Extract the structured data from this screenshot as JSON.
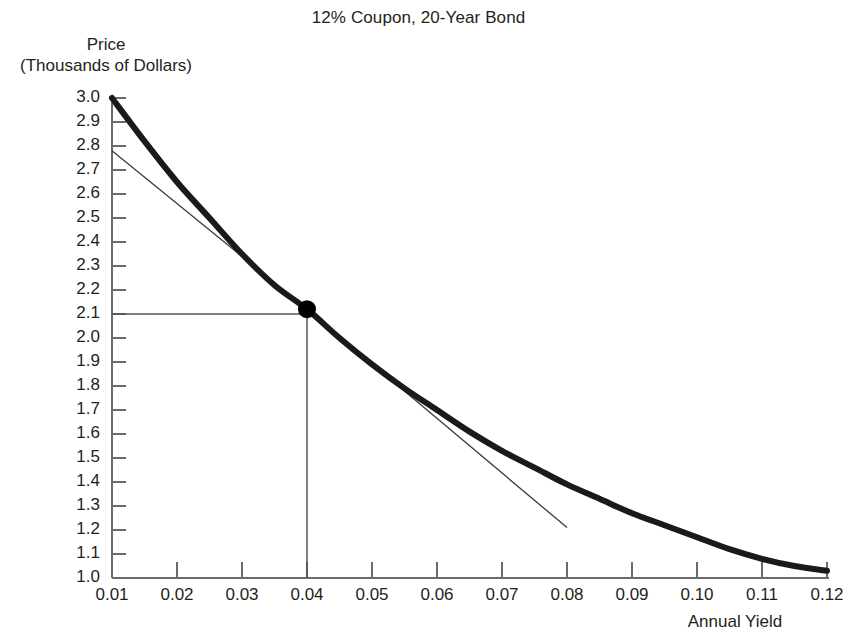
{
  "chart_data": {
    "type": "line",
    "title": "12% Coupon, 20-Year Bond",
    "xlabel": "Annual Yield",
    "ylabel": "Price\n(Thousands of Dollars)",
    "ylabel_line1": "Price",
    "ylabel_line2": "(Thousands of Dollars)",
    "xlim": [
      0.01,
      0.12
    ],
    "ylim": [
      1.0,
      3.0
    ],
    "grid": false,
    "legend": "none",
    "xticks": [
      "0.01",
      "0.02",
      "0.03",
      "0.04",
      "0.05",
      "0.06",
      "0.07",
      "0.08",
      "0.09",
      "0.10",
      "0.11",
      "0.12"
    ],
    "xtick_values": [
      0.01,
      0.02,
      0.03,
      0.04,
      0.05,
      0.06,
      0.07,
      0.08,
      0.09,
      0.1,
      0.11,
      0.12
    ],
    "yticks": [
      "3.0",
      "2.9",
      "2.8",
      "2.7",
      "2.6",
      "2.5",
      "2.4",
      "2.3",
      "2.2",
      "2.1",
      "2.0",
      "1.9",
      "1.8",
      "1.7",
      "1.6",
      "1.5",
      "1.4",
      "1.3",
      "1.2",
      "1.1",
      "1.0"
    ],
    "ytick_values": [
      3.0,
      2.9,
      2.8,
      2.7,
      2.6,
      2.5,
      2.4,
      2.3,
      2.2,
      2.1,
      2.0,
      1.9,
      1.8,
      1.7,
      1.6,
      1.5,
      1.4,
      1.3,
      1.2,
      1.1,
      1.0
    ],
    "series": [
      {
        "name": "price-yield curve",
        "style": "thick-solid",
        "color": "#1a1a1a",
        "x": [
          0.01,
          0.015,
          0.02,
          0.025,
          0.03,
          0.035,
          0.04,
          0.045,
          0.05,
          0.055,
          0.06,
          0.065,
          0.07,
          0.075,
          0.08,
          0.085,
          0.09,
          0.095,
          0.1,
          0.105,
          0.11,
          0.115,
          0.12
        ],
        "values": [
          3.0,
          2.82,
          2.65,
          2.5,
          2.35,
          2.22,
          2.12,
          2.0,
          1.89,
          1.79,
          1.7,
          1.61,
          1.53,
          1.46,
          1.39,
          1.33,
          1.27,
          1.22,
          1.17,
          1.12,
          1.08,
          1.05,
          1.03
        ]
      },
      {
        "name": "tangent line at 4% yield",
        "style": "thin-solid",
        "color": "#3c3c3c",
        "x": [
          0.01,
          0.04,
          0.08
        ],
        "values": [
          2.78,
          2.12,
          1.21
        ]
      }
    ],
    "annotations": [
      {
        "name": "tangency-point",
        "type": "marker",
        "x": 0.04,
        "y": 2.12,
        "marker": "filled-circle",
        "color": "#000000"
      },
      {
        "name": "price-reference-line",
        "type": "hline-segment",
        "y": 2.1,
        "x_from": 0.01,
        "x_to": 0.04,
        "color": "#555555"
      },
      {
        "name": "yield-reference-line",
        "type": "vline-segment",
        "x": 0.04,
        "y_from": 1.0,
        "y_to": 2.1,
        "color": "#555555"
      }
    ]
  },
  "axes": {
    "axis_color": "#6b6b6b",
    "tick_color": "#6b6b6b"
  }
}
